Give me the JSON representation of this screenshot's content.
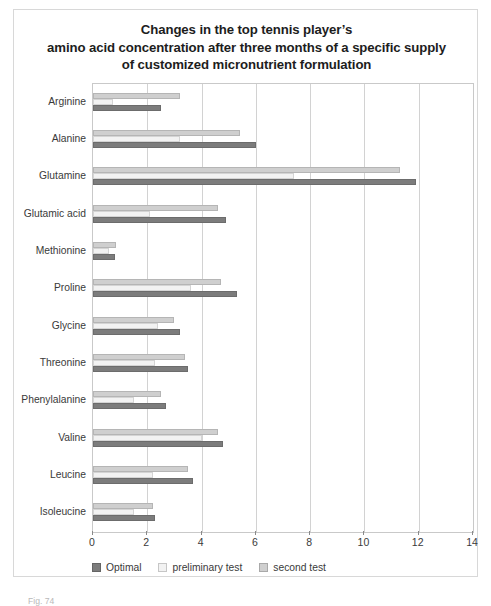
{
  "figure": {
    "title_lines": [
      "Changes in the top tennis player’s",
      "amino acid concentration after three months of a specific supply",
      "of customized micronutrient formulation"
    ],
    "caption": "Fig. 74"
  },
  "chart_data": {
    "type": "bar",
    "orientation": "horizontal",
    "title": "Changes in the top tennis player’s amino acid concentration after three months of a specific supply of customized micronutrient formulation",
    "xlabel": "",
    "ylabel": "",
    "xlim": [
      0,
      14
    ],
    "xticks": [
      0,
      2,
      4,
      6,
      8,
      10,
      12,
      14
    ],
    "xtick_labels": [
      "0",
      "2",
      "4",
      "6",
      "8",
      "10",
      "12",
      "14"
    ],
    "grid": true,
    "grid_axis": "x",
    "legend_position": "bottom-left",
    "categories": [
      "Arginine",
      "Alanine",
      "Glutamine",
      "Glutamic acid",
      "Methionine",
      "Proline",
      "Glycine",
      "Threonine",
      "Phenylalanine",
      "Valine",
      "Leucine",
      "Isoleucine"
    ],
    "series": [
      {
        "name": "second test",
        "color": "#cfcfcf",
        "values": [
          3.2,
          5.4,
          11.3,
          4.6,
          0.85,
          4.7,
          3.0,
          3.4,
          2.5,
          4.6,
          3.5,
          2.2
        ]
      },
      {
        "name": "preliminary test",
        "color": "#f2f2f2",
        "values": [
          0.75,
          3.2,
          7.4,
          2.1,
          0.6,
          3.6,
          2.4,
          2.3,
          1.5,
          4.0,
          2.2,
          1.5
        ]
      },
      {
        "name": "Optimal",
        "color": "#7c7c7c",
        "values": [
          2.5,
          6.0,
          11.9,
          4.9,
          0.8,
          5.3,
          3.2,
          3.5,
          2.7,
          4.8,
          3.7,
          2.3
        ]
      }
    ],
    "legend": [
      {
        "label": "Optimal",
        "color": "#7c7c7c"
      },
      {
        "label": "preliminary test",
        "color": "#f2f2f2"
      },
      {
        "label": "second test",
        "color": "#cfcfcf"
      }
    ]
  }
}
